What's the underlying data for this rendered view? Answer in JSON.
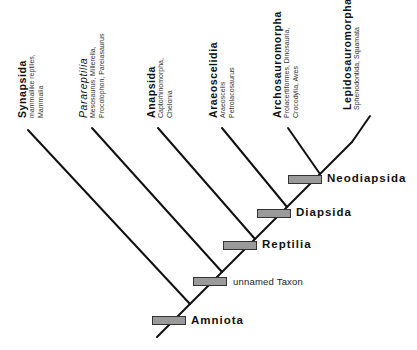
{
  "taxa": [
    {
      "name": "Synapsida",
      "sub1": "mammallike reptiles,",
      "sub2": "Mammalia"
    },
    {
      "name": "Parareptilia",
      "sub1": "Mesosaurus, Millerella,",
      "sub2": "Procolophon, Pareiasaurus"
    },
    {
      "name": "Anapsida",
      "sub1": "Captorhinomorpha,",
      "sub2": "Chelonia"
    },
    {
      "name": "Araeoscelidia",
      "sub1": "Araeoscelis",
      "sub2": "Petrolacosaurus"
    },
    {
      "name": "Archosauromorpha",
      "sub1": "Prolacertiformes, Dinosauria,",
      "sub2": "Crocodylia, Aves"
    },
    {
      "name": "Lepidosauromorpha",
      "sub1": "Sphenodontida, Squamata",
      "sub2": ""
    }
  ],
  "nodes": [
    {
      "label": "Neodiapsida"
    },
    {
      "label": "Diapsida"
    },
    {
      "label": "Reptilia"
    },
    {
      "label": "unnamed Taxon"
    },
    {
      "label": "Amniota"
    }
  ],
  "colors": {
    "line": "#111111",
    "box_fill": "#9a9a9a",
    "box_border": "#333333"
  }
}
